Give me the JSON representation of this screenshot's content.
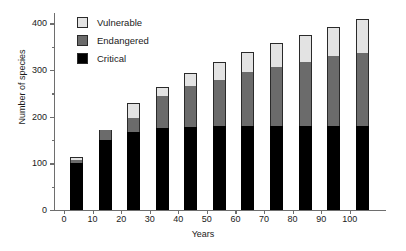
{
  "chart_data": {
    "type": "bar",
    "title": "",
    "subtitle": "",
    "xlabel": "Years",
    "ylabel": "Number of species",
    "stacked": true,
    "grid": false,
    "legend_position": "top-left-inside",
    "xlim": [
      -5,
      105
    ],
    "ylim": [
      0,
      420
    ],
    "yaxis_range_ticks": [
      0,
      400
    ],
    "categories": [
      "0",
      "10",
      "20",
      "30",
      "40",
      "50",
      "60",
      "70",
      "80",
      "90",
      "100"
    ],
    "x": [
      0,
      10,
      20,
      30,
      40,
      50,
      60,
      70,
      80,
      90,
      100
    ],
    "ytick_labels": [
      "0",
      "100",
      "200",
      "300",
      "400"
    ],
    "ytick_values": [
      0,
      100,
      200,
      300,
      400
    ],
    "yminor_tick_values": [
      50,
      150,
      250,
      350
    ],
    "series": [
      {
        "name": "Critical",
        "color": "#000000",
        "values": [
          100,
          150,
          168,
          175,
          178,
          180,
          180,
          180,
          180,
          180,
          180
        ]
      },
      {
        "name": "Endangered",
        "color": "#6b6b6b",
        "values": [
          8,
          22,
          30,
          70,
          87,
          98,
          115,
          127,
          138,
          150,
          157
        ]
      },
      {
        "name": "Vulnerable",
        "color": "#e3e3e3",
        "values": [
          5,
          0,
          32,
          19,
          28,
          40,
          44,
          50,
          57,
          63,
          73
        ]
      }
    ],
    "totals": [
      113,
      172,
      230,
      264,
      293,
      318,
      339,
      357,
      375,
      393,
      410
    ],
    "annotations": []
  },
  "legend": {
    "items": [
      {
        "label": "Vulnerable",
        "swatch": "vulnerable-swatch"
      },
      {
        "label": "Endangered",
        "swatch": "endangered-swatch"
      },
      {
        "label": "Critical",
        "swatch": "critical-swatch"
      }
    ]
  }
}
